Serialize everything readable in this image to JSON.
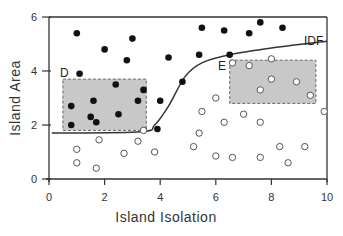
{
  "chart_data": {
    "type": "scatter",
    "title": "",
    "xlabel": "Island Isolation",
    "ylabel": "Island Area",
    "xlim": [
      0,
      10
    ],
    "ylim": [
      0,
      6
    ],
    "xticks": [
      "0",
      "2",
      "4",
      "6",
      "8",
      "10"
    ],
    "yticks": [
      "0",
      "2",
      "4",
      "6"
    ],
    "grid": false,
    "curve": {
      "label": "IDF",
      "points": [
        [
          0.1,
          1.7
        ],
        [
          3.3,
          1.75
        ],
        [
          3.8,
          2.0
        ],
        [
          4.3,
          2.7
        ],
        [
          4.9,
          3.8
        ],
        [
          5.5,
          4.3
        ],
        [
          6.5,
          4.6
        ],
        [
          8,
          4.85
        ],
        [
          10,
          5.1
        ]
      ]
    },
    "regions": [
      {
        "label": "D",
        "x": [
          0.5,
          3.5
        ],
        "y": [
          1.8,
          3.7
        ],
        "fill": "#c8c8c8"
      },
      {
        "label": "E",
        "x": [
          6.5,
          9.6
        ],
        "y": [
          2.8,
          4.4
        ],
        "fill": "#c8c8c8"
      }
    ],
    "series": [
      {
        "name": "filled",
        "marker": "filled-circle",
        "points": [
          [
            1.0,
            5.4
          ],
          [
            2.0,
            4.8
          ],
          [
            3.0,
            5.2
          ],
          [
            2.8,
            4.4
          ],
          [
            4.3,
            4.5
          ],
          [
            1.1,
            3.9
          ],
          [
            0.8,
            2.7
          ],
          [
            1.6,
            2.9
          ],
          [
            2.4,
            3.5
          ],
          [
            3.4,
            3.3
          ],
          [
            3.2,
            2.9
          ],
          [
            2.5,
            2.4
          ],
          [
            1.5,
            2.3
          ],
          [
            0.8,
            2.0
          ],
          [
            1.7,
            2.1
          ],
          [
            4.0,
            2.9
          ],
          [
            3.9,
            1.85
          ],
          [
            4.8,
            3.6
          ],
          [
            5.4,
            4.6
          ],
          [
            6.3,
            5.5
          ],
          [
            6.5,
            4.6
          ],
          [
            7.2,
            5.4
          ],
          [
            7.6,
            5.8
          ],
          [
            8.4,
            5.6
          ],
          [
            5.5,
            5.6
          ]
        ]
      },
      {
        "name": "open",
        "marker": "open-circle",
        "points": [
          [
            6.6,
            4.3
          ],
          [
            7.2,
            4.2
          ],
          [
            8.0,
            4.45
          ],
          [
            8.0,
            3.7
          ],
          [
            7.6,
            3.3
          ],
          [
            9.4,
            3.1
          ],
          [
            8.9,
            3.6
          ],
          [
            9.9,
            2.5
          ],
          [
            6.0,
            3.0
          ],
          [
            5.5,
            2.5
          ],
          [
            6.3,
            2.1
          ],
          [
            7.6,
            2.1
          ],
          [
            7.0,
            2.4
          ],
          [
            5.4,
            1.7
          ],
          [
            6.0,
            0.85
          ],
          [
            5.2,
            1.2
          ],
          [
            6.6,
            0.8
          ],
          [
            7.6,
            0.8
          ],
          [
            8.3,
            1.2
          ],
          [
            8.6,
            0.6
          ],
          [
            9.2,
            1.2
          ],
          [
            1.8,
            1.45
          ],
          [
            1.0,
            1.1
          ],
          [
            1.0,
            0.6
          ],
          [
            1.7,
            0.4
          ],
          [
            2.7,
            0.95
          ],
          [
            3.2,
            1.4
          ],
          [
            3.8,
            1.0
          ],
          [
            3.4,
            1.8
          ]
        ]
      }
    ]
  }
}
